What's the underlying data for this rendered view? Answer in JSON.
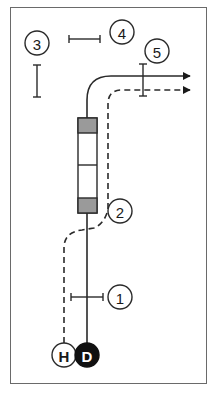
{
  "diagram": {
    "colors": {
      "line": "#2a2a2a",
      "frame": "#6a6a6a",
      "block_fill": "#9a9a9a",
      "dark_fill": "#111111",
      "background": "#ffffff"
    },
    "markers": [
      {
        "id": "1",
        "label": "1"
      },
      {
        "id": "2",
        "label": "2"
      },
      {
        "id": "3",
        "label": "3"
      },
      {
        "id": "4",
        "label": "4"
      },
      {
        "id": "5",
        "label": "5"
      }
    ],
    "start_points": [
      {
        "id": "H",
        "label": "H",
        "style": "outline"
      },
      {
        "id": "D",
        "label": "D",
        "style": "filled"
      }
    ],
    "routes": [
      {
        "name": "solid-route",
        "from": "D",
        "style": "solid",
        "ends_with": "arrow"
      },
      {
        "name": "dashed-route",
        "from": "H",
        "style": "dashed",
        "ends_with": "arrow"
      }
    ]
  }
}
